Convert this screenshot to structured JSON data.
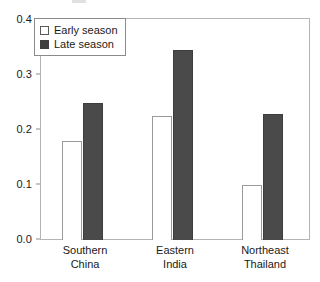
{
  "chart_data": {
    "type": "bar",
    "title": "",
    "xlabel": "",
    "ylabel": "",
    "ylim": [
      0.0,
      0.4
    ],
    "yticks": [
      "0.0",
      "0.1",
      "0.2",
      "0.3",
      "0.4"
    ],
    "ytick_values": [
      0.0,
      0.1,
      0.2,
      0.3,
      0.4
    ],
    "grid": false,
    "legend_position": "upper left",
    "categories": [
      "Southern China",
      "Eastern India",
      "Northeast Thailand"
    ],
    "category_lines": [
      [
        "Southern",
        "China"
      ],
      [
        "Eastern",
        "India"
      ],
      [
        "Northeast",
        "Thailand"
      ]
    ],
    "series": [
      {
        "name": "Early season",
        "color": "#ffffff",
        "edge_color": "#9a9a9a",
        "values": [
          0.18,
          0.225,
          0.1
        ]
      },
      {
        "name": "Late season",
        "color": "#4a4a4a",
        "edge_color": "#3d3d3d",
        "values": [
          0.25,
          0.345,
          0.23
        ]
      }
    ]
  },
  "legend": {
    "entries": [
      {
        "label": "Early season",
        "swatch": "open-square"
      },
      {
        "label": "Late season",
        "swatch": "filled-square"
      }
    ]
  },
  "colors": {
    "early_fill": "#ffffff",
    "late_fill": "#4a4a4a",
    "axis": "#b4b4b4",
    "text": "#1a1a1a"
  }
}
